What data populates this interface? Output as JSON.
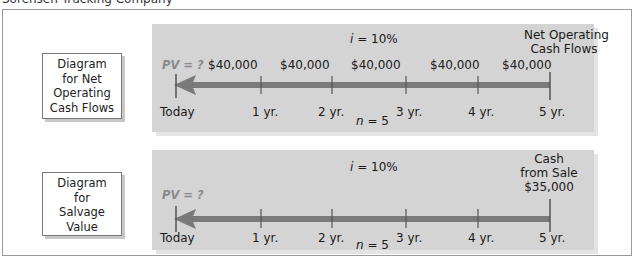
{
  "caption": "Sorensen Trucking Company",
  "diagrams": [
    {
      "label_lines": [
        "Diagram",
        "for Net",
        "Operating",
        "Cash Flows"
      ],
      "rate_var": "i",
      "rate_value": "= 10%",
      "pv_label": "PV = ?",
      "flow_header_lines": [
        "Net Operating",
        "Cash Flows"
      ],
      "flows": [
        "$40,000",
        "$40,000",
        "$40,000",
        "$40,000",
        "$40,000"
      ],
      "ticks": [
        "Today",
        "1 yr.",
        "2 yr.",
        "3 yr.",
        "4 yr.",
        "5 yr."
      ],
      "n_var": "n",
      "n_value": "= 5"
    },
    {
      "label_lines": [
        "Diagram",
        "for",
        "Salvage",
        "Value"
      ],
      "rate_var": "i",
      "rate_value": "= 10%",
      "pv_label": "PV = ?",
      "flow_header_lines": [
        "Cash",
        "from Sale",
        "$35,000"
      ],
      "ticks": [
        "Today",
        "1 yr.",
        "2 yr.",
        "3 yr.",
        "4 yr.",
        "5 yr."
      ],
      "n_var": "n",
      "n_value": "= 5"
    }
  ],
  "colors": {
    "panel_bg": "#d4d4d4",
    "arrow": "#7a7a7a",
    "pv_text": "#8a8a8a",
    "frame_border": "#9a9a9a"
  }
}
